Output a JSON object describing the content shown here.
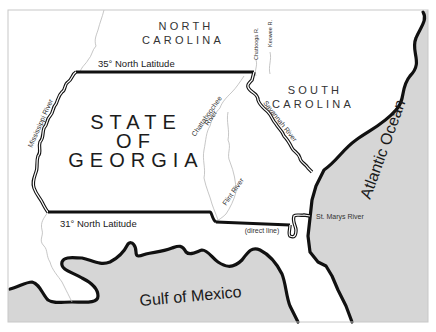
{
  "map": {
    "title": "State of Georgia",
    "colors": {
      "water": "#d6d6d6",
      "land": "#ffffff",
      "border": "#111111",
      "river": "#b8b8b8"
    },
    "labels": {
      "north_carolina_line1": "NORTH",
      "north_carolina_line2": "CAROLINA",
      "south_carolina_line1": "SOUTH",
      "south_carolina_line2": "CAROLINA",
      "georgia_line1": "STATE",
      "georgia_line2": "OF",
      "georgia_line3": "GEORGIA",
      "lat_35": "35° North Latitude",
      "lat_31": "31° North Latitude",
      "direct_line": "(direct line)",
      "mississippi_river": "Mississippi River",
      "chattahoochee_line1": "Chattahoochee",
      "chattahoochee_line2": "River",
      "flint_river": "Flint River",
      "savannah_river": "Savannah River",
      "chattooga_river": "Chattooga R.",
      "keowee_river": "Keowee R.",
      "st_marys_river": "St. Marys River",
      "atlantic_ocean": "Atlantic Ocean",
      "gulf_of_mexico": "Gulf of Mexico"
    }
  }
}
